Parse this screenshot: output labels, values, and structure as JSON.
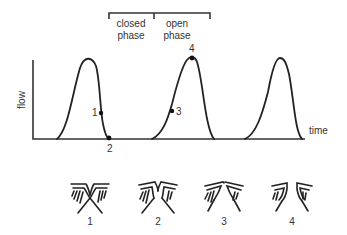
{
  "figure": {
    "bracket": {
      "closed_label_line1": "closed",
      "closed_label_line2": "phase",
      "open_label_line1": "open",
      "open_label_line2": "phase"
    },
    "axes": {
      "ylabel": "flow",
      "xlabel": "time"
    },
    "points": [
      {
        "id": "1",
        "label": "1"
      },
      {
        "id": "2",
        "label": "2"
      },
      {
        "id": "3",
        "label": "3"
      },
      {
        "id": "4",
        "label": "4"
      }
    ],
    "vocal_fold_diagrams": [
      {
        "label": "1"
      },
      {
        "label": "2"
      },
      {
        "label": "3"
      },
      {
        "label": "4"
      }
    ]
  }
}
